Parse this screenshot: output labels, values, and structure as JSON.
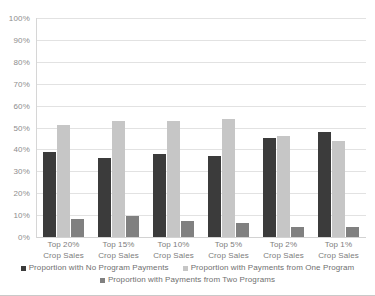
{
  "chart_data": {
    "type": "bar",
    "title": "",
    "subtitle": "",
    "xlabel": "",
    "ylabel": "",
    "ylim": [
      0,
      100
    ],
    "y_tick_labels": [
      "100%",
      "90%",
      "80%",
      "70%",
      "60%",
      "50%",
      "40%",
      "30%",
      "20%",
      "10%",
      "0%"
    ],
    "y_tick_values": [
      100,
      90,
      80,
      70,
      60,
      50,
      40,
      30,
      20,
      10,
      0
    ],
    "grid": "horizontal",
    "legend_position": "bottom",
    "categories": [
      "Top 20% Crop Sales",
      "Top 15% Crop Sales",
      "Top 10% Crop Sales",
      "Top 5% Crop Sales",
      "Top 2% Crop Sales",
      "Top 1% Crop Sales"
    ],
    "category_lines": [
      [
        "Top 20%",
        "Crop Sales"
      ],
      [
        "Top 15%",
        "Crop Sales"
      ],
      [
        "Top 10%",
        "Crop Sales"
      ],
      [
        "Top 5%",
        "Crop Sales"
      ],
      [
        "Top 2%",
        "Crop Sales"
      ],
      [
        "Top 1%",
        "Crop Sales"
      ]
    ],
    "series": [
      {
        "name": "Proportion with No Program Payments",
        "color": "#3b3b3b",
        "values": [
          39,
          36,
          38,
          37,
          45,
          48
        ]
      },
      {
        "name": "Proportion with Payments from One Program",
        "color": "#c6c6c6",
        "values": [
          51,
          53,
          53,
          54,
          46,
          44
        ]
      },
      {
        "name": "Proportion with Payments from Two Programs",
        "color": "#808080",
        "values": [
          8,
          9.5,
          7.5,
          6.5,
          4.5,
          4.5
        ]
      }
    ]
  },
  "legend": {
    "row1": [
      {
        "label": "Proportion with No Program Payments",
        "color": "#3b3b3b"
      },
      {
        "label": "Proportion with Payments from One Program",
        "color": "#c6c6c6"
      }
    ],
    "row2": [
      {
        "label": "Proportion with Payments from Two Programs",
        "color": "#808080"
      }
    ]
  }
}
